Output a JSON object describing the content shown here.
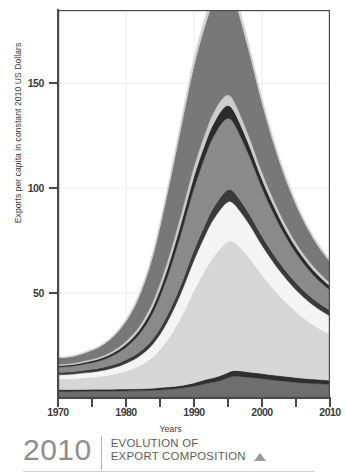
{
  "yaxis": {
    "label": "Exports per capita in constant 2010 US Dollars",
    "ticks": [
      {
        "value": 50,
        "label": "50"
      },
      {
        "value": 100,
        "label": "100"
      },
      {
        "value": 150,
        "label": "150"
      }
    ]
  },
  "xaxis": {
    "label": "Years",
    "major_ticks": [
      {
        "value": 1970,
        "label": "1970"
      },
      {
        "value": 1980,
        "label": "1980"
      },
      {
        "value": 1990,
        "label": "1990"
      },
      {
        "value": 2000,
        "label": "2000"
      },
      {
        "value": 2010,
        "label": "2010"
      }
    ],
    "minor_ticks": [
      1975,
      1985,
      1995,
      2005
    ]
  },
  "caption": {
    "year": "2010",
    "line1": "EVOLUTION OF",
    "line2": "EXPORT COMPOSITION",
    "marker_icon": "triangle-up-icon"
  },
  "colors": {
    "axis": "#4a4a4a",
    "grid": "#ededed",
    "tick_text": "#3b3b3b",
    "axis_title": "#3c3c3c",
    "caption_year": "#8e8e8e",
    "caption_text": "#5c5c5c"
  },
  "chart_data": {
    "type": "area",
    "title": "EVOLUTION OF EXPORT COMPOSITION",
    "xlabel": "Years",
    "ylabel": "Exports per capita in constant 2010 US Dollars",
    "xlim": [
      1970,
      2010
    ],
    "ylim": [
      0,
      185
    ],
    "grid": true,
    "stacked": true,
    "legend": "none",
    "x": [
      1970,
      1972,
      1974,
      1976,
      1978,
      1980,
      1982,
      1984,
      1986,
      1988,
      1990,
      1992,
      1993,
      1994,
      1995,
      1996,
      1998,
      2000,
      2002,
      2004,
      2006,
      2008,
      2010
    ],
    "series": [
      {
        "name": "layer-1-base-dark",
        "color": "#6e6e6e",
        "values": [
          3.0,
          3.0,
          3.1,
          3.2,
          3.2,
          3.3,
          3.4,
          3.6,
          4.0,
          4.6,
          5.6,
          7.0,
          7.6,
          8.4,
          9.6,
          10.4,
          9.8,
          9.2,
          8.4,
          7.8,
          7.2,
          6.8,
          6.4
        ]
      },
      {
        "name": "layer-2-dark-line",
        "color": "#2f2f2f",
        "values": [
          1.0,
          1.0,
          1.0,
          1.0,
          1.0,
          1.0,
          1.0,
          1.1,
          1.2,
          1.3,
          1.6,
          2.0,
          2.2,
          2.4,
          2.6,
          2.7,
          2.6,
          2.5,
          2.4,
          2.3,
          2.2,
          2.1,
          2.0
        ]
      },
      {
        "name": "layer-3-light-mid",
        "color": "#d6d6d6",
        "values": [
          5.0,
          5.2,
          5.6,
          6.0,
          7.0,
          8.6,
          11.0,
          15.0,
          22.0,
          32.0,
          44.0,
          54.0,
          58.0,
          61.0,
          62.5,
          61.0,
          55.0,
          47.0,
          40.0,
          34.0,
          29.0,
          25.0,
          22.0
        ]
      },
      {
        "name": "layer-4-near-white",
        "color": "#f4f4f4",
        "values": [
          2.0,
          2.1,
          2.3,
          2.6,
          3.0,
          3.6,
          4.6,
          6.2,
          8.6,
          11.5,
          14.5,
          17.0,
          18.0,
          18.6,
          18.8,
          18.0,
          16.0,
          14.0,
          12.4,
          11.0,
          10.0,
          9.2,
          8.6
        ]
      },
      {
        "name": "layer-5-dark-band",
        "color": "#3a3a3a",
        "values": [
          1.2,
          1.2,
          1.3,
          1.4,
          1.5,
          1.7,
          2.0,
          2.5,
          3.2,
          4.0,
          4.8,
          5.4,
          5.6,
          5.8,
          5.8,
          5.6,
          5.0,
          4.4,
          3.9,
          3.5,
          3.2,
          3.0,
          2.8
        ]
      },
      {
        "name": "layer-6-mid-gray",
        "color": "#8a8a8a",
        "values": [
          2.5,
          2.6,
          2.9,
          3.4,
          4.4,
          6.0,
          8.6,
          12.6,
          18.0,
          24.0,
          29.5,
          33.0,
          34.0,
          34.5,
          34.0,
          32.5,
          28.0,
          23.0,
          19.0,
          15.5,
          13.0,
          11.0,
          9.6
        ]
      },
      {
        "name": "layer-7-dark-thin",
        "color": "#2b2b2b",
        "values": [
          0.8,
          0.8,
          0.9,
          1.0,
          1.2,
          1.5,
          2.0,
          2.8,
          3.8,
          4.8,
          5.6,
          6.0,
          6.2,
          6.2,
          6.1,
          5.8,
          5.0,
          4.2,
          3.5,
          3.0,
          2.6,
          2.3,
          2.0
        ]
      },
      {
        "name": "layer-8-light-thin",
        "color": "#cccccc",
        "values": [
          0.6,
          0.6,
          0.7,
          0.8,
          1.0,
          1.3,
          1.8,
          2.5,
          3.4,
          4.2,
          4.8,
          5.1,
          5.2,
          5.2,
          5.1,
          4.8,
          4.1,
          3.4,
          2.8,
          2.4,
          2.0,
          1.8,
          1.5
        ]
      },
      {
        "name": "layer-9-top-gray",
        "color": "#787878",
        "values": [
          3.0,
          3.2,
          3.8,
          4.8,
          6.6,
          9.6,
          14.5,
          22.0,
          32.0,
          41.0,
          48.0,
          52.0,
          53.0,
          53.0,
          52.0,
          49.0,
          41.0,
          33.0,
          26.0,
          20.5,
          16.0,
          12.5,
          10.0
        ]
      },
      {
        "name": "layer-10-top-highlight",
        "color": "#d2d2d2",
        "values": [
          0.4,
          0.4,
          0.5,
          0.6,
          0.8,
          1.1,
          1.5,
          2.1,
          2.8,
          3.4,
          3.9,
          4.1,
          4.2,
          4.2,
          4.1,
          3.9,
          3.3,
          2.7,
          2.2,
          1.8,
          1.5,
          1.3,
          1.1
        ]
      }
    ]
  }
}
